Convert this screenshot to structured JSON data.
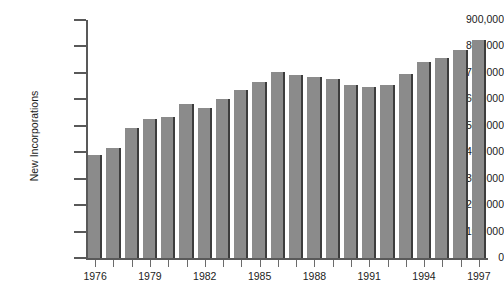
{
  "chart_data": {
    "type": "bar",
    "title": "",
    "xlabel": "",
    "ylabel": "New Incorporations",
    "ylim": [
      0,
      900000
    ],
    "xlim": [
      1976,
      1997
    ],
    "grid": false,
    "legend": null,
    "bar_color": "#8b8b8b",
    "bar_edge_color": "#3d3d3d",
    "axis_color": "#595959",
    "text_color": "#1c1c1c",
    "background": "#ffffff",
    "ytick_labels": [
      "900,000",
      "800,000",
      "700,000",
      "600,000",
      "500,000",
      "400,000",
      "300,000",
      "200,000",
      "100,000",
      "0"
    ],
    "ytick_values": [
      900000,
      800000,
      700000,
      600000,
      500000,
      400000,
      300000,
      200000,
      100000,
      0
    ],
    "xtick_labels": [
      "1976",
      "",
      "",
      "1979",
      "",
      "",
      "1982",
      "",
      "",
      "1985",
      "",
      "",
      "1988",
      "",
      "",
      "1991",
      "",
      "",
      "1994",
      "",
      "",
      "1997"
    ],
    "visible_xtick_labels": [
      "1976",
      "1979",
      "1982",
      "1985",
      "1988",
      "1991",
      "1994",
      "1997"
    ],
    "categories": [
      1976,
      1977,
      1978,
      1979,
      1980,
      1981,
      1982,
      1983,
      1984,
      1985,
      1986,
      1987,
      1988,
      1989,
      1990,
      1991,
      1992,
      1993,
      1994,
      1995,
      1996,
      1997
    ],
    "values": [
      389000,
      415000,
      490000,
      527000,
      532000,
      581000,
      566000,
      600000,
      634000,
      664000,
      702000,
      692000,
      685000,
      677000,
      655000,
      648000,
      656000,
      697000,
      741000,
      755000,
      786000,
      825000
    ]
  }
}
